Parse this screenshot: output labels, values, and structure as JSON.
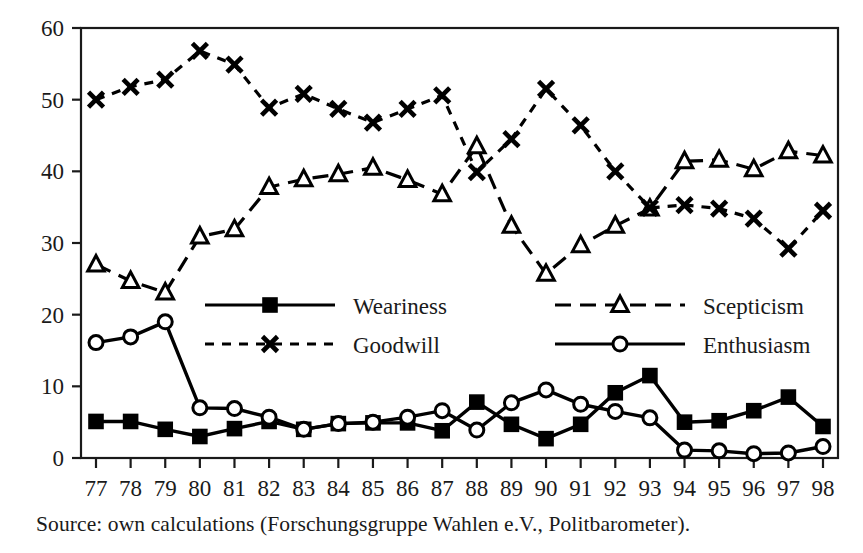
{
  "chart_data": {
    "type": "line",
    "title": "",
    "subtitle": "",
    "xlabel": "",
    "ylabel": "",
    "xlim": [
      1977,
      1998
    ],
    "ylim": [
      0,
      60
    ],
    "ytick_step": 10,
    "grid": false,
    "legend_position": "inside-center",
    "categories": [
      "77",
      "78",
      "79",
      "80",
      "81",
      "82",
      "83",
      "84",
      "85",
      "86",
      "87",
      "88",
      "89",
      "90",
      "91",
      "92",
      "93",
      "94",
      "95",
      "96",
      "97",
      "98"
    ],
    "x": [
      1977,
      1978,
      1979,
      1980,
      1981,
      1982,
      1983,
      1984,
      1985,
      1986,
      1987,
      1988,
      1989,
      1990,
      1991,
      1992,
      1993,
      1994,
      1995,
      1996,
      1997,
      1998
    ],
    "yticks": [
      0,
      10,
      20,
      30,
      40,
      50,
      60
    ],
    "series": [
      {
        "name": "Weariness",
        "marker": "filled-square",
        "line_style": "solid",
        "color": "#000000",
        "values": [
          5.1,
          5.1,
          4.0,
          3.0,
          4.1,
          5.1,
          4.0,
          4.8,
          4.9,
          4.9,
          3.8,
          7.8,
          4.7,
          2.7,
          4.7,
          9.1,
          11.5,
          5.0,
          5.2,
          6.6,
          8.5,
          4.4
        ]
      },
      {
        "name": "Scepticism",
        "marker": "open-triangle",
        "line_style": "dashed",
        "color": "#000000",
        "values": [
          27.0,
          24.7,
          23.1,
          30.9,
          31.9,
          37.8,
          38.9,
          39.6,
          40.5,
          38.8,
          36.8,
          43.5,
          32.4,
          25.7,
          29.7,
          32.4,
          34.8,
          41.4,
          41.6,
          40.3,
          42.8,
          42.2
        ]
      },
      {
        "name": "Goodwill",
        "marker": "cross-x",
        "line_style": "dotted",
        "color": "#000000",
        "values": [
          50.0,
          51.8,
          52.8,
          56.8,
          54.9,
          48.9,
          50.8,
          48.7,
          46.8,
          48.7,
          50.6,
          39.9,
          44.5,
          51.5,
          46.4,
          40.0,
          34.9,
          35.3,
          34.8,
          33.4,
          29.2,
          34.5
        ]
      },
      {
        "name": "Enthusiasm",
        "marker": "open-circle",
        "line_style": "solid",
        "color": "#000000",
        "values": [
          16.1,
          16.9,
          19.0,
          7.0,
          6.9,
          5.7,
          4.0,
          4.8,
          5.0,
          5.7,
          6.6,
          3.9,
          7.7,
          9.5,
          7.5,
          6.5,
          5.6,
          1.1,
          1.0,
          0.6,
          0.7,
          1.6
        ]
      }
    ]
  },
  "axes": {
    "y_tick_labels": [
      "60",
      "50",
      "40",
      "30",
      "20",
      "10",
      "0"
    ],
    "x_tick_labels": [
      "77",
      "78",
      "79",
      "80",
      "81",
      "82",
      "83",
      "84",
      "85",
      "86",
      "87",
      "88",
      "89",
      "90",
      "91",
      "92",
      "93",
      "94",
      "95",
      "96",
      "97",
      "98"
    ]
  },
  "legend": {
    "entries": [
      {
        "label": "Weariness",
        "marker": "filled-square",
        "line_style": "solid"
      },
      {
        "label": "Scepticism",
        "marker": "open-triangle",
        "line_style": "dashed"
      },
      {
        "label": "Goodwill",
        "marker": "cross-x",
        "line_style": "dotted"
      },
      {
        "label": "Enthusiasm",
        "marker": "open-circle",
        "line_style": "solid"
      }
    ]
  },
  "source": {
    "text": "Source: own calculations (Forschungsgruppe Wahlen e.V., Politbarometer)."
  },
  "colors": {
    "ink": "#1a1a1a",
    "line": "#000000",
    "background": "#ffffff"
  }
}
